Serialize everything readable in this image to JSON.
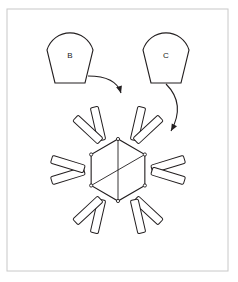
{
  "figure": {
    "background_color": "#ffffff",
    "frame": {
      "name": "figure-border",
      "color": "#c8c8c8",
      "x": 7,
      "y": 9,
      "width": 221,
      "height": 262
    },
    "line_color": "#231f20",
    "label_color": "#1a1a1a"
  },
  "parts": [
    {
      "id": "B",
      "label": "B",
      "shape": "rounded-wedge",
      "label_x": 70,
      "label_y": 56,
      "cx": 70,
      "cy": 55,
      "top_radius": 24,
      "bottom_half_width": 15,
      "top_y": 26,
      "bottom_y": 83
    },
    {
      "id": "C",
      "label": "C",
      "shape": "rounded-wedge",
      "label_x": 166,
      "label_y": 56,
      "cx": 166,
      "cy": 55,
      "top_radius": 24,
      "bottom_half_width": 15,
      "top_y": 26,
      "bottom_y": 83
    }
  ],
  "arrows": [
    {
      "name": "arrow-b-to-top-petal",
      "from_part": "B",
      "to_target": "top-petal",
      "start_x": 88,
      "start_y": 76,
      "control_x": 116,
      "control_y": 76,
      "end_x": 121,
      "end_y": 93
    },
    {
      "name": "arrow-c-to-upper-right-petal",
      "from_part": "C",
      "to_target": "upper-right-petal",
      "start_x": 166,
      "start_y": 84,
      "control_x": 186,
      "control_y": 104,
      "end_x": 171,
      "end_y": 131
    }
  ],
  "rosette": {
    "name": "rosette-assembly",
    "center_x": 118,
    "center_y": 170,
    "hexagon_radius": 31,
    "hexagon_rotation_deg": 0,
    "petal_count": 6,
    "petal_center_distance": 47,
    "petal_radius": 35,
    "teeth_per_petal": 7,
    "tooth_width": 6,
    "tooth_height": 7,
    "capsules_per_petal": 2,
    "capsule_length": 34,
    "capsule_width": 8,
    "diagonals": 2,
    "petal_angles_deg": [
      270,
      330,
      30,
      90,
      150,
      210
    ],
    "petal_names": [
      "top-petal",
      "upper-right-petal",
      "lower-right-petal",
      "bottom-petal",
      "lower-left-petal",
      "upper-left-petal"
    ]
  }
}
